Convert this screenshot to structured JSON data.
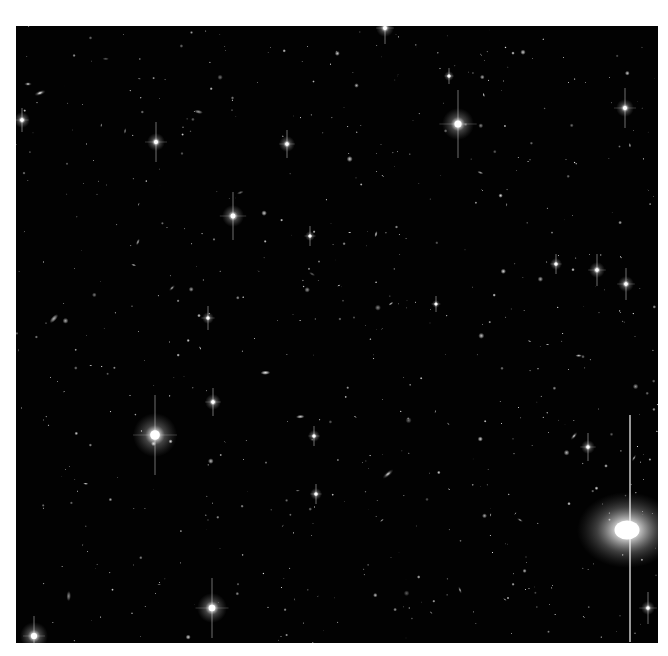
{
  "image": {
    "subject": "deep-field astronomical image of stars and galaxies",
    "background_color": "#020202",
    "frame_color": "#ffffff",
    "field": {
      "left": 16,
      "top": 26,
      "width": 642,
      "height": 617
    }
  },
  "bright_stars": [
    {
      "x": 458,
      "y": 124,
      "r": 16,
      "spike": 34
    },
    {
      "x": 155,
      "y": 435,
      "r": 22,
      "spike": 40
    },
    {
      "x": 212,
      "y": 608,
      "r": 15,
      "spike": 30
    },
    {
      "x": 233,
      "y": 216,
      "r": 11,
      "spike": 24
    },
    {
      "x": 156,
      "y": 142,
      "r": 9,
      "spike": 20
    },
    {
      "x": 625,
      "y": 108,
      "r": 9,
      "spike": 20
    },
    {
      "x": 597,
      "y": 270,
      "r": 8,
      "spike": 16
    },
    {
      "x": 626,
      "y": 284,
      "r": 8,
      "spike": 16
    },
    {
      "x": 287,
      "y": 144,
      "r": 8,
      "spike": 14
    },
    {
      "x": 213,
      "y": 402,
      "r": 8,
      "spike": 14
    },
    {
      "x": 208,
      "y": 318,
      "r": 6,
      "spike": 12
    },
    {
      "x": 588,
      "y": 447,
      "r": 7,
      "spike": 14
    },
    {
      "x": 385,
      "y": 28,
      "r": 9,
      "spike": 16
    },
    {
      "x": 22,
      "y": 120,
      "r": 8,
      "spike": 12
    },
    {
      "x": 34,
      "y": 636,
      "r": 14,
      "spike": 20
    },
    {
      "x": 648,
      "y": 608,
      "r": 7,
      "spike": 16
    },
    {
      "x": 556,
      "y": 264,
      "r": 6,
      "spike": 10
    },
    {
      "x": 310,
      "y": 236,
      "r": 5,
      "spike": 10
    },
    {
      "x": 314,
      "y": 436,
      "r": 6,
      "spike": 10
    },
    {
      "x": 316,
      "y": 494,
      "r": 6,
      "spike": 10
    },
    {
      "x": 449,
      "y": 76,
      "r": 5,
      "spike": 8
    },
    {
      "x": 436,
      "y": 304,
      "r": 4,
      "spike": 8
    }
  ],
  "galaxies": [
    {
      "x": 627,
      "y": 530,
      "rx": 50,
      "ry": 38,
      "angle": 0,
      "brightness": 1.0
    },
    {
      "x": 40,
      "y": 93,
      "rx": 6,
      "ry": 2.5,
      "angle": -20,
      "brightness": 0.8
    },
    {
      "x": 28,
      "y": 84,
      "rx": 4,
      "ry": 2,
      "angle": 0,
      "brightness": 0.7
    },
    {
      "x": 388,
      "y": 474,
      "rx": 7,
      "ry": 2.5,
      "angle": -40,
      "brightness": 0.7
    },
    {
      "x": 574,
      "y": 436,
      "rx": 5,
      "ry": 2,
      "angle": -50,
      "brightness": 0.7
    },
    {
      "x": 634,
      "y": 458,
      "rx": 4,
      "ry": 1.5,
      "angle": -60,
      "brightness": 0.6
    },
    {
      "x": 172,
      "y": 288,
      "rx": 4,
      "ry": 1.8,
      "angle": -45,
      "brightness": 0.6
    },
    {
      "x": 460,
      "y": 590,
      "rx": 4,
      "ry": 1.5,
      "angle": 70,
      "brightness": 0.6
    },
    {
      "x": 520,
      "y": 520,
      "rx": 3.5,
      "ry": 1.5,
      "angle": 30,
      "brightness": 0.6
    }
  ],
  "streaks": [
    {
      "x": 630,
      "y1": 415,
      "y2": 642,
      "width": 1.6,
      "opacity": 0.75
    }
  ],
  "faint_star_count": 620,
  "faint_star_seed": 20240517
}
